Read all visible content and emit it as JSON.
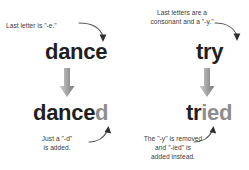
{
  "diagram": {
    "background_color": "#ffffff",
    "text_color": "#3a3a3a",
    "word_color": "#221f1f",
    "suffix_color": "#8d8d8d",
    "arrow_color": "#9a9a9a",
    "curve_color": "#555555"
  },
  "columns": [
    {
      "id": "dance",
      "top_caption": "Last letter is \"-e.\"",
      "base_word": {
        "stem": "danc",
        "tail": "e",
        "full": "dance"
      },
      "result_word": {
        "stem": "dance",
        "suffix": "d",
        "full": "danced"
      },
      "bottom_caption": "Just a \"-d\"\nis added."
    },
    {
      "id": "try",
      "top_caption": "Last letters are a\nconsonant and a \"-y.\"",
      "base_word": {
        "stem": "tr",
        "tail": "y",
        "full": "try"
      },
      "result_word": {
        "stem": "tr",
        "suffix": "ied",
        "full": "tried"
      },
      "bottom_caption": "The \"-y\" is removed\nand \"-ied\" is\nadded instead."
    }
  ],
  "icons": {
    "down_block_arrow": "down-block-arrow",
    "pointer_curve": "curved-pointer-arrow"
  }
}
